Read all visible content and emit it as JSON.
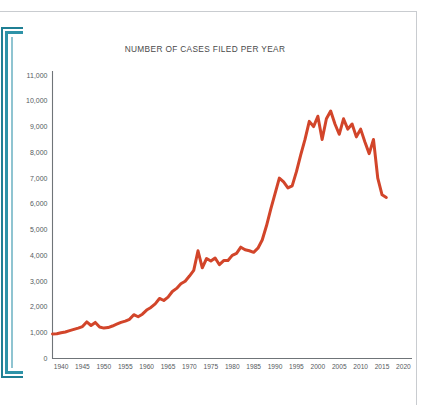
{
  "document": {
    "side_bracket_color": "#2e93a8",
    "page_border_color": "#c9ccd0"
  },
  "chart_data": {
    "type": "line",
    "title": "NUMBER OF CASES FILED PER YEAR",
    "xlabel": "",
    "ylabel": "",
    "xlim": [
      1938,
      2022
    ],
    "ylim": [
      0,
      11000
    ],
    "grid": false,
    "legend": false,
    "line_color": "#d2452a",
    "axis_color": "#6f7478",
    "x_ticks": [
      1940,
      1945,
      1950,
      1955,
      1960,
      1965,
      1970,
      1975,
      1980,
      1985,
      1990,
      1995,
      2000,
      2005,
      2010,
      2015,
      2020
    ],
    "x_tick_labels": [
      "1940",
      "1945",
      "1950",
      "1955",
      "1960",
      "1965",
      "1970",
      "1975",
      "1980",
      "1985",
      "1990",
      "1995",
      "2000",
      "2005",
      "2010",
      "2015",
      "2020"
    ],
    "y_ticks": [
      0,
      1000,
      2000,
      3000,
      4000,
      5000,
      6000,
      7000,
      8000,
      9000,
      10000,
      11000
    ],
    "y_tick_labels": [
      "0",
      "1,000",
      "2,000",
      "3,000",
      "4,000",
      "5,000",
      "6,000",
      "7,000",
      "8,000",
      "9,000",
      "10,000",
      "11,000"
    ],
    "x": [
      1938,
      1939,
      1940,
      1941,
      1942,
      1943,
      1944,
      1945,
      1946,
      1947,
      1948,
      1949,
      1950,
      1951,
      1952,
      1953,
      1954,
      1955,
      1956,
      1957,
      1958,
      1959,
      1960,
      1961,
      1962,
      1963,
      1964,
      1965,
      1966,
      1967,
      1968,
      1969,
      1970,
      1971,
      1972,
      1973,
      1974,
      1975,
      1976,
      1977,
      1978,
      1979,
      1980,
      1981,
      1982,
      1983,
      1984,
      1985,
      1986,
      1987,
      1988,
      1989,
      1990,
      1991,
      1992,
      1993,
      1994,
      1995,
      1996,
      1997,
      1998,
      1999,
      2000,
      2001,
      2002,
      2003,
      2004,
      2005,
      2006,
      2007,
      2008,
      2009,
      2010,
      2011,
      2012,
      2013,
      2014,
      2015,
      2016
    ],
    "values": [
      950,
      960,
      1000,
      1030,
      1080,
      1130,
      1180,
      1240,
      1420,
      1280,
      1400,
      1220,
      1180,
      1200,
      1260,
      1330,
      1400,
      1450,
      1520,
      1700,
      1620,
      1720,
      1880,
      1980,
      2120,
      2330,
      2250,
      2380,
      2600,
      2720,
      2900,
      3000,
      3200,
      3420,
      4180,
      3520,
      3880,
      3780,
      3900,
      3640,
      3800,
      3800,
      4000,
      4080,
      4320,
      4220,
      4180,
      4120,
      4280,
      4600,
      5150,
      5800,
      6400,
      7000,
      6850,
      6620,
      6700,
      7250,
      7900,
      8500,
      9200,
      9000,
      9400,
      8500,
      9300,
      9600,
      9100,
      8700,
      9300,
      8900,
      9100,
      8600,
      8900,
      8400,
      7950,
      8500,
      7000,
      6350,
      6250
    ],
    "series_name": "Cases filed"
  }
}
